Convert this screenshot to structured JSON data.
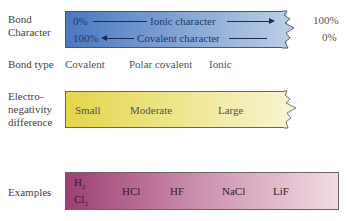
{
  "rows": {
    "bond_character": {
      "label_line1": "Bond",
      "label_line2": "Character",
      "top_left": "0%",
      "top_text": "Ionic character",
      "top_right": "100%",
      "bottom_left": "100%",
      "bottom_text": "Covalent character",
      "bottom_right": "0%",
      "color_start": "#4a78c0",
      "color_end": "#b9cde6"
    },
    "bond_type": {
      "label": "Bond type",
      "values": [
        "Covalent",
        "Polar covalent",
        "Ionic"
      ]
    },
    "electronegativity": {
      "label_line1": "Electro-",
      "label_line2": "negativity",
      "label_line3": "difference",
      "values": [
        "Small",
        "Moderate",
        "Large"
      ],
      "color_start": "#e3d64a",
      "color_end": "#f8f4cf"
    },
    "examples": {
      "label": "Examples",
      "first_top": "H",
      "first_top_sub": "2",
      "first_bottom": "Cl",
      "first_bottom_sub": "2",
      "values": [
        "HCl",
        "HF",
        "NaCl",
        "LiF"
      ],
      "color_start": "#9c3f73",
      "color_end": "#f1dce4"
    }
  }
}
